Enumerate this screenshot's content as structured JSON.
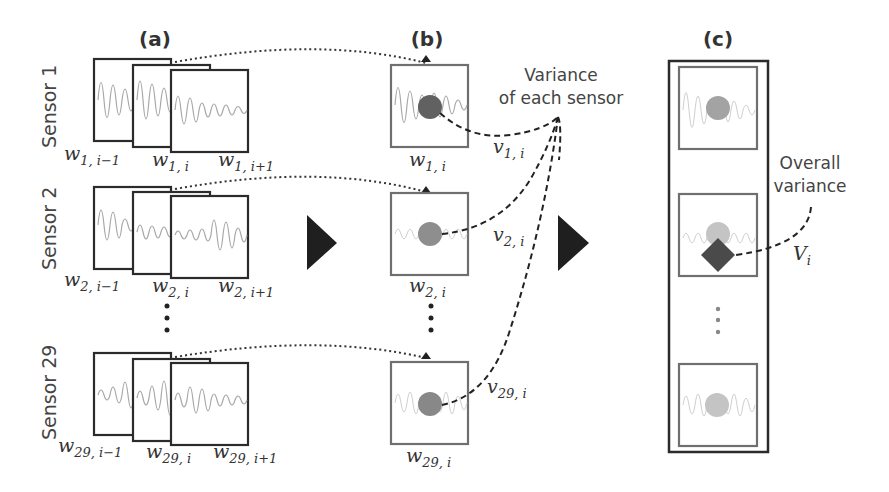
{
  "panels": {
    "a": {
      "label": "(a)"
    },
    "b": {
      "label": "(b)"
    },
    "c": {
      "label": "(c)"
    }
  },
  "sensors": [
    {
      "name": "Sensor 1",
      "windows": [
        {
          "base": "w",
          "sub": "1, i−1"
        },
        {
          "base": "w",
          "sub": "1, i"
        },
        {
          "base": "w",
          "sub": "1, i+1"
        }
      ],
      "selected_window": {
        "base": "w",
        "sub": "1, i"
      },
      "variance": {
        "base": "v",
        "sub": "1, i"
      },
      "circle_color": "#616161"
    },
    {
      "name": "Sensor 2",
      "windows": [
        {
          "base": "w",
          "sub": "2, i−1"
        },
        {
          "base": "w",
          "sub": "2, i"
        },
        {
          "base": "w",
          "sub": "2, i+1"
        }
      ],
      "selected_window": {
        "base": "w",
        "sub": "2, i"
      },
      "variance": {
        "base": "v",
        "sub": "2, i"
      },
      "circle_color": "#8e8e8e"
    },
    {
      "name": "Sensor 29",
      "windows": [
        {
          "base": "w",
          "sub": "29, i−1"
        },
        {
          "base": "w",
          "sub": "29, i"
        },
        {
          "base": "w",
          "sub": "29, i+1"
        }
      ],
      "selected_window": {
        "base": "w",
        "sub": "29, i"
      },
      "variance": {
        "base": "v",
        "sub": "29, i"
      },
      "circle_color": "#888888"
    }
  ],
  "annotations": {
    "variance_each_line1": "Variance",
    "variance_each_line2": "of each sensor",
    "overall_line1": "Overall",
    "overall_line2": "variance",
    "overall_symbol": {
      "base": "V",
      "sub": "i"
    }
  },
  "colors": {
    "frame": "#2b2b2b",
    "inner_frame": "#6f6f6f",
    "arrow": "#1f1f1f",
    "diamond": "#4a4a4a",
    "light_circle": "#c4c4c4"
  }
}
